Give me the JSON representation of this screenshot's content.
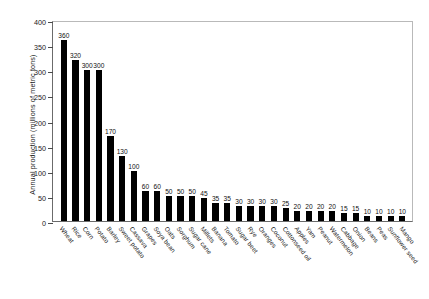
{
  "chart_data": {
    "type": "bar",
    "title": "",
    "xlabel": "",
    "ylabel": "Annual production (millions of metric tons)",
    "ylim": [
      0,
      400
    ],
    "yticks": [
      0,
      50,
      100,
      150,
      200,
      250,
      300,
      350,
      400
    ],
    "grid": false,
    "legend": null,
    "bar_color": "#000000",
    "value_labels_shown": true,
    "categories": [
      "Wheat",
      "Rice",
      "Corn",
      "Potato",
      "Barley",
      "Sweet potato",
      "Cassava",
      "Grapes",
      "Soya bean",
      "Oats",
      "Sorghum",
      "Sugar cane",
      "Millets",
      "Banana",
      "Tomato",
      "Sugar beet",
      "Rye",
      "Oranges",
      "Coconut",
      "Cottonseed oil",
      "Apples",
      "Yam",
      "Peanut",
      "Watermelon",
      "Cabbage",
      "Onion",
      "Beans",
      "Peas",
      "Sunflower seed",
      "Mango"
    ],
    "values": [
      360,
      320,
      300,
      300,
      170,
      130,
      100,
      60,
      60,
      50,
      50,
      50,
      45,
      35,
      35,
      30,
      30,
      30,
      30,
      25,
      20,
      20,
      20,
      20,
      15,
      15,
      10,
      10,
      10,
      10
    ]
  }
}
